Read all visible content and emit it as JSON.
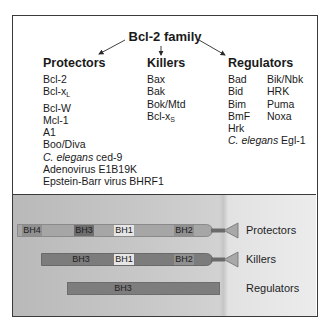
{
  "title": "Bcl-2 family",
  "columns": {
    "protectors": {
      "heading": "Protectors",
      "items": [
        {
          "text": "Bcl-2"
        },
        {
          "text": "Bcl-x",
          "sub": "L"
        },
        {
          "text": "Bcl-W"
        },
        {
          "text": "Mcl-1"
        },
        {
          "text": "A1"
        },
        {
          "text": "Boo/Diva"
        },
        {
          "italic": "C. elegans",
          "text": " ced-9"
        },
        {
          "text": "Adenovirus E1B19K"
        },
        {
          "text": "Epstein-Barr virus BHRF1"
        }
      ]
    },
    "killers": {
      "heading": "Killers",
      "items": [
        {
          "text": "Bax"
        },
        {
          "text": "Bak"
        },
        {
          "text": "Bok/Mtd"
        },
        {
          "text": "Bcl-x",
          "sub": "S"
        }
      ]
    },
    "regulators": {
      "heading": "Regulators",
      "items_left": [
        "Bad",
        "Bid",
        "Bim",
        "BmF",
        "Hrk"
      ],
      "items_right": [
        "Bik/Nbk",
        "HRK",
        "Puma",
        "Noxa"
      ],
      "last": {
        "italic": "C. elegans",
        "text": " Egl-1"
      }
    }
  },
  "domains": {
    "protectors": {
      "label": "Protectors",
      "segments": [
        "BH4",
        "BH3",
        "BH1",
        "BH2"
      ],
      "has_tm_anchor": true
    },
    "killers": {
      "label": "Killers",
      "segments": [
        "BH3",
        "BH1",
        "BH2"
      ],
      "has_tm_anchor": true
    },
    "regulators": {
      "label": "Regulators",
      "segments": [
        "BH3"
      ],
      "has_tm_anchor": false
    }
  }
}
